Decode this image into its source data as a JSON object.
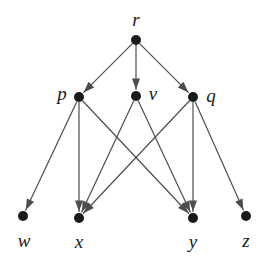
{
  "figure": {
    "background_color": "#ffffff",
    "width": 271,
    "height": 259
  },
  "style": {
    "node_color": "#1a1a1a",
    "node_radius": 5,
    "edge_color": "#4d4d4d",
    "edge_width": 1.2,
    "label_color": "#1a1a1a",
    "arrow_color": "#4d4d4d",
    "arrow_length": 11,
    "arrow_width": 8
  },
  "graph": {
    "directed": true,
    "nodes": [
      {
        "id": "r",
        "label": "r",
        "x": 136,
        "y": 40,
        "label_x": 136,
        "label_y": 19,
        "level": 0
      },
      {
        "id": "p",
        "label": "p",
        "x": 79,
        "y": 97,
        "label_x": 62,
        "label_y": 93,
        "level": 1
      },
      {
        "id": "v",
        "label": "v",
        "x": 136,
        "y": 96,
        "label_x": 153,
        "label_y": 93,
        "level": 1
      },
      {
        "id": "q",
        "label": "q",
        "x": 193,
        "y": 97,
        "label_x": 211,
        "label_y": 95,
        "level": 1
      },
      {
        "id": "w",
        "label": "w",
        "x": 23,
        "y": 216,
        "label_x": 24,
        "label_y": 240,
        "level": 2
      },
      {
        "id": "x",
        "label": "x",
        "x": 79,
        "y": 218,
        "label_x": 79,
        "label_y": 241,
        "level": 2
      },
      {
        "id": "y",
        "label": "y",
        "x": 193,
        "y": 218,
        "label_x": 193,
        "label_y": 241,
        "level": 2
      },
      {
        "id": "z",
        "label": "z",
        "x": 246,
        "y": 216,
        "label_x": 246,
        "label_y": 240,
        "level": 2
      }
    ],
    "edges": [
      {
        "from": "r",
        "to": "p"
      },
      {
        "from": "r",
        "to": "v"
      },
      {
        "from": "r",
        "to": "q"
      },
      {
        "from": "p",
        "to": "w"
      },
      {
        "from": "p",
        "to": "x"
      },
      {
        "from": "p",
        "to": "y"
      },
      {
        "from": "v",
        "to": "x"
      },
      {
        "from": "v",
        "to": "y"
      },
      {
        "from": "q",
        "to": "x"
      },
      {
        "from": "q",
        "to": "y"
      },
      {
        "from": "q",
        "to": "z"
      }
    ]
  }
}
